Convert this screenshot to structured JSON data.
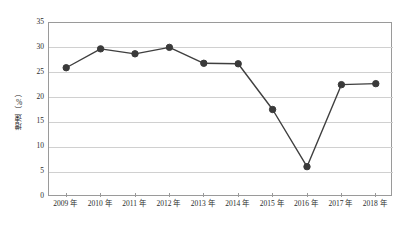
{
  "chart_data": {
    "type": "line",
    "title": "",
    "subtitle": "",
    "xlabel": "",
    "ylabel": "增速（%）",
    "categories": [
      "2009 年",
      "2010 年",
      "2011 年",
      "2012 年",
      "2013 年",
      "2014 年",
      "2015 年",
      "2016 年",
      "2017 年",
      "2018 年"
    ],
    "x": [
      2009,
      2010,
      2011,
      2012,
      2013,
      2014,
      2015,
      2016,
      2017,
      2018
    ],
    "values": [
      26.0,
      29.8,
      28.8,
      30.1,
      26.9,
      26.8,
      17.6,
      6.1,
      22.6,
      22.8
    ],
    "series": [
      {
        "name": "增速（%）",
        "values": [
          26.0,
          29.8,
          28.8,
          30.1,
          26.9,
          26.8,
          17.6,
          6.1,
          22.6,
          22.8
        ]
      }
    ],
    "ylim": [
      0,
      35
    ],
    "ytick_labels": [
      "0",
      "5",
      "10",
      "15",
      "20",
      "25",
      "30",
      "35"
    ],
    "ytick_values": [
      0,
      5,
      10,
      15,
      20,
      25,
      30,
      35
    ],
    "ystep": 5,
    "grid": "horizontal",
    "legend": "none",
    "colors": {
      "line": "#3f3f3f",
      "marker": "#3a3a3a",
      "gridline": "#d0d0d0",
      "axis": "#9a9a9a",
      "text": "#2b2b2b",
      "background": "#ffffff"
    }
  }
}
